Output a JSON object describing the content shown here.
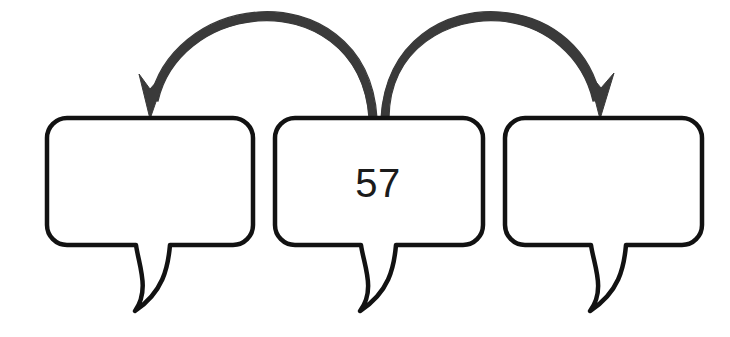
{
  "canvas": {
    "width": 730,
    "height": 337,
    "background": "#ffffff"
  },
  "style": {
    "bubble_stroke_color": "#121212",
    "bubble_fill_color": "#ffffff",
    "bubble_stroke_width": 4.5,
    "bubble_corner_radius": 20,
    "arrow_color": "#3a3a3a",
    "arrow_stroke_width": 7,
    "text_color": "#1b1b1b",
    "text_font_size": 40
  },
  "diagram": {
    "type": "speech-bubble-sequence",
    "bubbles": [
      {
        "id": "bubble-left",
        "label": "left-speech-bubble",
        "value": "",
        "x": 47,
        "y": 118,
        "width": 206,
        "height": 127,
        "filled": false
      },
      {
        "id": "bubble-middle",
        "label": "middle-speech-bubble",
        "value": "57",
        "x": 275,
        "y": 118,
        "width": 208,
        "height": 127,
        "filled": true
      },
      {
        "id": "bubble-right",
        "label": "right-speech-bubble",
        "value": "",
        "x": 505,
        "y": 118,
        "width": 197,
        "height": 127,
        "filled": false
      }
    ],
    "arrows": [
      {
        "id": "arrow-middle-to-left",
        "label": "arrow-pointing-left",
        "from": "bubble-middle",
        "to": "bubble-left",
        "direction": "left",
        "start_x": 377,
        "start_y": 118,
        "end_x": 150,
        "end_y": 117,
        "peak_y": 14
      },
      {
        "id": "arrow-middle-to-right",
        "label": "arrow-pointing-right",
        "from": "bubble-middle",
        "to": "bubble-right",
        "direction": "right",
        "start_x": 381,
        "start_y": 118,
        "end_x": 600,
        "end_y": 117,
        "peak_y": 14
      }
    ]
  }
}
